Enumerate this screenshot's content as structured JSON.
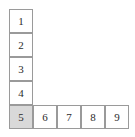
{
  "figure": {
    "name": "l-shaped-numbered-grid",
    "shape": "L",
    "background_color": "#ffffff",
    "cell_border_color": "#9a9a9a",
    "cell_fill_color": "#ffffff",
    "highlight_fill_color": "#d9d9d9",
    "text_color": "#2b2b2b",
    "cell_size_px": 24,
    "grid_origin": {
      "x": 9,
      "y": 9
    },
    "column": {
      "name": "vertical-arm",
      "cells": [
        {
          "label": "1",
          "col": 0,
          "row": 0,
          "shaded": false
        },
        {
          "label": "2",
          "col": 0,
          "row": 1,
          "shaded": false
        },
        {
          "label": "3",
          "col": 0,
          "row": 2,
          "shaded": false
        },
        {
          "label": "4",
          "col": 0,
          "row": 3,
          "shaded": false
        }
      ]
    },
    "corner": {
      "name": "corner-cell",
      "cell": {
        "label": "5",
        "col": 0,
        "row": 4,
        "shaded": true
      }
    },
    "row": {
      "name": "horizontal-arm",
      "cells": [
        {
          "label": "6",
          "col": 1,
          "row": 4,
          "shaded": false
        },
        {
          "label": "7",
          "col": 2,
          "row": 4,
          "shaded": false
        },
        {
          "label": "8",
          "col": 3,
          "row": 4,
          "shaded": false
        },
        {
          "label": "9",
          "col": 4,
          "row": 4,
          "shaded": false
        }
      ]
    }
  }
}
